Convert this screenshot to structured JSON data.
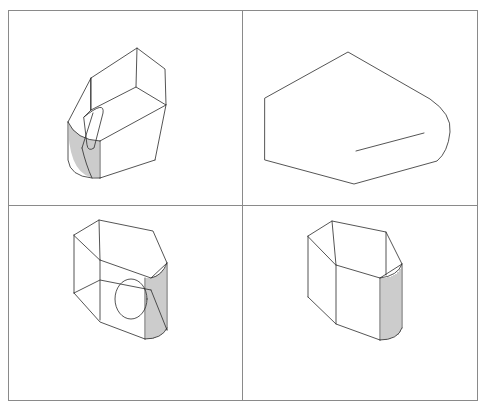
{
  "figure": {
    "description": "CAD multi-viewport drawing of an extruded pentagonal solid with one rounded (cylindrical) end and a circular hole",
    "layout": "2x2 viewports",
    "colors": {
      "background": "#ffffff",
      "frame": "#8a8a8a",
      "edges": "#2a2a2a"
    }
  },
  "viewports": [
    {
      "id": "top-left",
      "view": "isometric view from above (with hole slot visible, hatched cylindrical face)"
    },
    {
      "id": "top-right",
      "view": "top / plan view (pentagon outline with rounded right end and hole line)"
    },
    {
      "id": "bottom-left",
      "view": "isometric view with circular hole and hatched cylindrical face"
    },
    {
      "id": "bottom-right",
      "view": "isometric view showing hatched cylindrical face"
    }
  ]
}
